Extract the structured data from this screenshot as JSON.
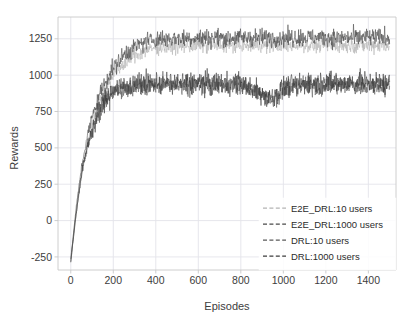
{
  "chart_data": {
    "type": "line",
    "title": "",
    "xlabel": "Episodes",
    "ylabel": "Rewards",
    "xlim": [
      -60,
      1530
    ],
    "ylim": [
      -340,
      1400
    ],
    "xticks": [
      0,
      200,
      400,
      600,
      800,
      1000,
      1200,
      1400
    ],
    "yticks": [
      -250,
      0,
      250,
      500,
      750,
      1000,
      1250
    ],
    "xtick_labels": [
      "0",
      "200",
      "400",
      "600",
      "800",
      "1000",
      "1200",
      "1400"
    ],
    "ytick_labels": [
      "-250",
      "0",
      "250",
      "500",
      "750",
      "1000",
      "1250"
    ],
    "grid": true,
    "legend_position": "lower right",
    "series": [
      {
        "name": "E2E_DRL:10 users",
        "color": "#b4b4b4",
        "linestyle": "dashed",
        "start_value": -260,
        "plateau_value": 1205,
        "noise": 45,
        "x": [
          0,
          25,
          50,
          75,
          100,
          125,
          150,
          175,
          200,
          250,
          300,
          350,
          400,
          500,
          600,
          700,
          800,
          900,
          1000,
          1100,
          1200,
          1300,
          1400,
          1500
        ],
        "y": [
          -260,
          60,
          330,
          520,
          660,
          770,
          860,
          935,
          995,
          1080,
          1135,
          1170,
          1190,
          1200,
          1203,
          1205,
          1205,
          1206,
          1205,
          1207,
          1206,
          1205,
          1207,
          1206
        ]
      },
      {
        "name": "E2E_DRL:1000 users",
        "color": "#4a4a4a",
        "linestyle": "dashed",
        "start_value": -270,
        "plateau_value": 1258,
        "noise": 55,
        "x": [
          0,
          25,
          50,
          75,
          100,
          125,
          150,
          175,
          200,
          250,
          300,
          350,
          400,
          500,
          600,
          700,
          800,
          900,
          1000,
          1100,
          1200,
          1300,
          1400,
          1500
        ],
        "y": [
          -270,
          80,
          360,
          560,
          710,
          825,
          915,
          990,
          1050,
          1140,
          1195,
          1230,
          1248,
          1255,
          1257,
          1258,
          1258,
          1259,
          1258,
          1260,
          1259,
          1258,
          1260,
          1259
        ]
      },
      {
        "name": "DRL:10 users",
        "color": "#5a5a5a",
        "linestyle": "dashed",
        "start_value": -280,
        "plateau_value": 930,
        "noise": 62,
        "x": [
          0,
          25,
          50,
          75,
          100,
          125,
          150,
          175,
          200,
          250,
          300,
          350,
          400,
          500,
          600,
          700,
          800,
          900,
          950,
          1000,
          1100,
          1200,
          1300,
          1400,
          1500
        ],
        "y": [
          -280,
          40,
          300,
          480,
          610,
          710,
          790,
          850,
          890,
          915,
          925,
          928,
          930,
          930,
          931,
          930,
          930,
          880,
          845,
          905,
          930,
          931,
          930,
          932,
          930
        ]
      },
      {
        "name": "DRL:1000 users",
        "color": "#3c3c3c",
        "linestyle": "dashed",
        "start_value": -285,
        "plateau_value": 945,
        "noise": 68,
        "x": [
          0,
          25,
          50,
          75,
          100,
          125,
          150,
          175,
          200,
          250,
          300,
          350,
          400,
          500,
          600,
          700,
          800,
          900,
          950,
          1000,
          1100,
          1200,
          1300,
          1400,
          1500
        ],
        "y": [
          -285,
          50,
          315,
          495,
          625,
          725,
          805,
          862,
          900,
          925,
          938,
          942,
          945,
          945,
          946,
          945,
          944,
          870,
          830,
          915,
          944,
          946,
          945,
          947,
          945
        ]
      }
    ],
    "annotations": [
      {
        "text": "dip in DRL curves near episodes 880-1000",
        "x": 940,
        "y": 840
      }
    ]
  },
  "legend": {
    "entries": [
      {
        "label": "E2E_DRL:10 users",
        "color": "#b4b4b4"
      },
      {
        "label": "E2E_DRL:1000 users",
        "color": "#4a4a4a"
      },
      {
        "label": "DRL:10 users",
        "color": "#5a5a5a"
      },
      {
        "label": "DRL:1000 users",
        "color": "#3c3c3c"
      }
    ]
  },
  "axes": {
    "xlabel": "Episodes",
    "ylabel": "Rewards"
  },
  "colors": {
    "grid": "#e3e3ea",
    "spine": "#c8c8c8",
    "text": "#3d3d3d",
    "background": "#ffffff"
  }
}
